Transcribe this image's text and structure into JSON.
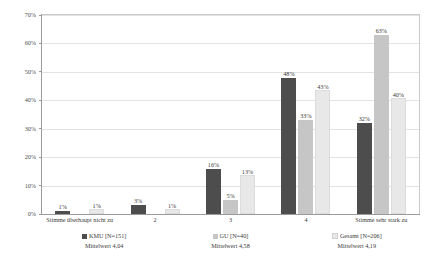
{
  "chart_data": {
    "type": "bar",
    "title": "",
    "subtitle": "",
    "xlabel": "",
    "ylabel": "",
    "ylim": [
      0,
      70
    ],
    "grid": true,
    "legend_position": "bottom",
    "categories": [
      "Stimme überhaupt nicht zu",
      "2",
      "3",
      "4",
      "Stimme sehr stark zu"
    ],
    "ytick_labels": [
      "70%",
      "60%",
      "50%",
      "40%",
      "30%",
      "20%",
      "10%",
      "0%"
    ],
    "ytick_values": [
      70,
      60,
      50,
      40,
      30,
      20,
      10,
      0
    ],
    "series": [
      {
        "name": "KMU [N=151]",
        "mean_label": "Mittelwert 4,04",
        "color": "#4d4d4d",
        "values": [
          1,
          3,
          16,
          48,
          32
        ],
        "value_labels": [
          "1%",
          "3%",
          "16%",
          "48%",
          "32%"
        ]
      },
      {
        "name": "GU [N=40]",
        "mean_label": "Mittelwert 4,58",
        "color": "#c6c6c6",
        "values": [
          0,
          0,
          5,
          33,
          63
        ],
        "value_labels": [
          "",
          "",
          "5%",
          "33%",
          "63%"
        ]
      },
      {
        "name": "Gesamt [N=206]",
        "mean_label": "Mittelwert 4,19",
        "color": "#e8e8e8",
        "values": [
          1,
          1,
          13,
          43,
          40
        ],
        "value_labels": [
          "1%",
          "1%",
          "13%",
          "43%",
          "40%"
        ]
      }
    ]
  },
  "colors": {
    "series_kmu": "#4d4d4d",
    "series_gu": "#c6c6c6",
    "series_gesamt": "#e8e8e8",
    "grid": "#e2e2e2",
    "axis": "#9a9a9a",
    "text": "#3a3a3a",
    "background": "#ffffff"
  }
}
